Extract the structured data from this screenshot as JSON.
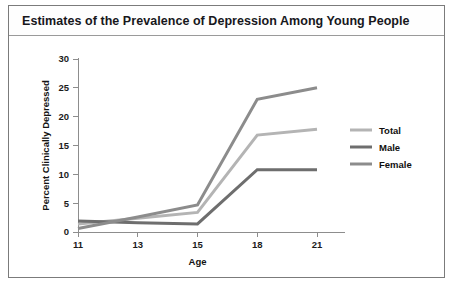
{
  "figure": {
    "title": "Estimates of the Prevalence of Depression Among Young People"
  },
  "chart_data": {
    "type": "line",
    "title": "Estimates of the Prevalence of Depression Among Young People",
    "xlabel": "Age",
    "ylabel": "Percent Clinically Depressed",
    "categories": [
      "11",
      "13",
      "15",
      "18",
      "21"
    ],
    "x": [
      11,
      13,
      15,
      18,
      21
    ],
    "xtick_labels": [
      "11",
      "13",
      "15",
      "18",
      "21"
    ],
    "ytick_labels": [
      "0",
      "5",
      "10",
      "15",
      "20",
      "25",
      "30"
    ],
    "yticks": [
      0,
      5,
      10,
      15,
      20,
      25,
      30
    ],
    "ylim": [
      0,
      30
    ],
    "grid": false,
    "legend_position": "right",
    "series": [
      {
        "name": "Total",
        "color": "#b4b4b4",
        "values": [
          1.4,
          2.4,
          3.4,
          16.8,
          17.8
        ]
      },
      {
        "name": "Male",
        "color": "#6e6e6e",
        "values": [
          1.9,
          1.6,
          1.4,
          10.8,
          10.8
        ]
      },
      {
        "name": "Female",
        "color": "#8c8c8c",
        "values": [
          0.6,
          2.6,
          4.7,
          23.0,
          25.0
        ]
      }
    ]
  },
  "legend": {
    "items": [
      {
        "label": "Total",
        "color": "#b4b4b4"
      },
      {
        "label": "Male",
        "color": "#6e6e6e"
      },
      {
        "label": "Female",
        "color": "#8c8c8c"
      }
    ]
  }
}
